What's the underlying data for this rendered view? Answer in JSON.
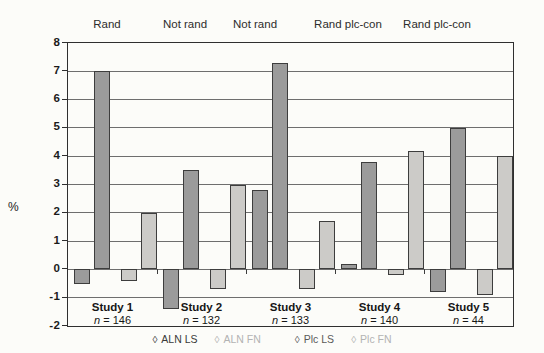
{
  "chart_data": {
    "type": "bar",
    "title": "",
    "xlabel": "",
    "ylabel": "%",
    "ylim": [
      -2,
      8
    ],
    "ytick_step": 1,
    "ytick_labels": [
      "8",
      "7",
      "6",
      "5",
      "4",
      "3",
      "2",
      "1",
      "0",
      "-1",
      "-2"
    ],
    "grid": true,
    "categories": [
      "Study 1",
      "Study 2",
      "Study 3",
      "Study 4",
      "Study 5"
    ],
    "category_sublabels": [
      "n = 146",
      "n = 132",
      "n = 133",
      "n = 140",
      "n = 44"
    ],
    "group_top_labels": [
      "Rand",
      "Not rand",
      "Not rand",
      "Rand plc-con",
      "Rand plc-con"
    ],
    "series": [
      {
        "name": "Plc LS",
        "color": "#9b9b9b",
        "values": [
          -0.5,
          -1.4,
          2.8,
          0.2,
          -0.8
        ]
      },
      {
        "name": "ALN LS",
        "color": "#9b9b9b",
        "values": [
          7.0,
          3.5,
          7.3,
          3.8,
          5.0
        ]
      },
      {
        "name": "Plc FN",
        "color": "#cccbc8",
        "values": [
          -0.4,
          -0.7,
          -0.7,
          -0.2,
          -0.9
        ]
      },
      {
        "name": "ALN FN",
        "color": "#cccbc8",
        "values": [
          2.0,
          3.0,
          1.7,
          4.2,
          4.0
        ]
      }
    ],
    "legend": [
      {
        "label": "ALN LS",
        "symbol": "◊",
        "color": "#3a3a3a"
      },
      {
        "label": "ALN FN",
        "symbol": "◊",
        "color": "#b3b3b3"
      },
      {
        "label": "Plc LS",
        "symbol": "◊",
        "color": "#5a5a5a"
      },
      {
        "label": "Plc FN",
        "symbol": "◊",
        "color": "#b3b3b3"
      }
    ],
    "legend_position": "bottom",
    "layout": {
      "top_label_x_px": [
        107,
        185,
        255,
        348,
        437
      ],
      "bar_offsets_in_group_px": [
        6,
        26,
        53,
        73
      ],
      "bar_width_px": 16,
      "group_width_px": 89
    }
  }
}
